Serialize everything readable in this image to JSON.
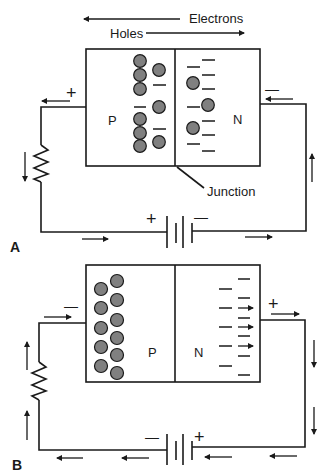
{
  "figure_a": {
    "label": "A",
    "top_labels": {
      "electrons": "Electrons",
      "holes": "Holes"
    },
    "p_region_label": "P",
    "n_region_label": "N",
    "junction_label": "Junction",
    "left_terminal_sign": "+",
    "right_terminal_sign": "—",
    "battery_plus": "+",
    "battery_minus": "—",
    "description": "Forward bias: holes and electrons move toward the junction"
  },
  "figure_b": {
    "label": "B",
    "p_region_label": "P",
    "n_region_label": "N",
    "left_terminal_sign": "—",
    "right_terminal_sign": "+",
    "battery_plus": "+",
    "battery_minus": "—",
    "description": "Reverse bias: holes and electrons pulled away from the junction"
  },
  "colors": {
    "line": "#1a1a1a",
    "hole_fill": "#808080",
    "background": "#ffffff"
  }
}
